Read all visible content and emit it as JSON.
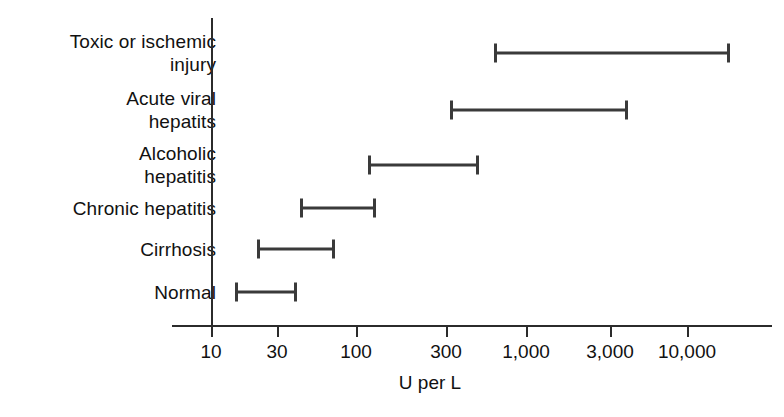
{
  "chart_data": {
    "type": "range-bar",
    "title": "",
    "xlabel": "U per L",
    "ylabel": "",
    "scale": "log",
    "xlim": [
      10,
      25000
    ],
    "grid": false,
    "legend": null,
    "xticks": [
      {
        "value": 10,
        "label": "10"
      },
      {
        "value": 30,
        "label": "30"
      },
      {
        "value": 100,
        "label": "100"
      },
      {
        "value": 300,
        "label": "300"
      },
      {
        "value": 1000,
        "label": "1,000"
      },
      {
        "value": 3000,
        "label": "3,000"
      },
      {
        "value": 10000,
        "label": "10,000"
      }
    ],
    "categories": [
      "Toxic or ischemic injury",
      "Acute viral hepatits",
      "Alcoholic hepatitis",
      "Chronic hepatitis",
      "Cirrhosis",
      "Normal"
    ],
    "ranges": [
      {
        "category": "Toxic or ischemic injury",
        "label": "Toxic or ischemic\ninjury",
        "low": 700,
        "high": 25000
      },
      {
        "category": "Acute viral hepatits",
        "label": "Acute viral\nhepatits",
        "low": 320,
        "high": 3700
      },
      {
        "category": "Alcoholic hepatitis",
        "label": "Alcoholic\nhepatitis",
        "low": 115,
        "high": 460
      },
      {
        "category": "Chronic hepatitis",
        "label": "Chronic hepatitis",
        "low": 42,
        "high": 135
      },
      {
        "category": "Cirrhosis",
        "label": "Cirrhosis",
        "low": 22,
        "high": 75
      },
      {
        "category": "Normal",
        "label": "Normal",
        "low": 15,
        "high": 40
      }
    ],
    "colors": {
      "bar": "#3a3a3a",
      "axis": "#2b2b2b",
      "text": "#111111",
      "background": "#ffffff"
    }
  },
  "layout": {
    "rows_y_px": [
      53,
      110,
      165,
      208,
      249,
      292
    ],
    "axis": {
      "y_axis_x_px": 211,
      "y_axis_top_px": 18,
      "y_axis_bottom_px": 327,
      "x_axis_y_px": 325,
      "x_axis_left_px": 172,
      "x_axis_right_px": 772
    },
    "tick_x_px": [
      211,
      277,
      356,
      446,
      526,
      610,
      687
    ],
    "bar_px": [
      {
        "x1": 495,
        "x2": 729
      },
      {
        "x1": 451,
        "x2": 627
      },
      {
        "x1": 369,
        "x2": 478
      },
      {
        "x1": 301,
        "x2": 375
      },
      {
        "x1": 258,
        "x2": 334
      },
      {
        "x1": 236,
        "x2": 296
      }
    ]
  }
}
